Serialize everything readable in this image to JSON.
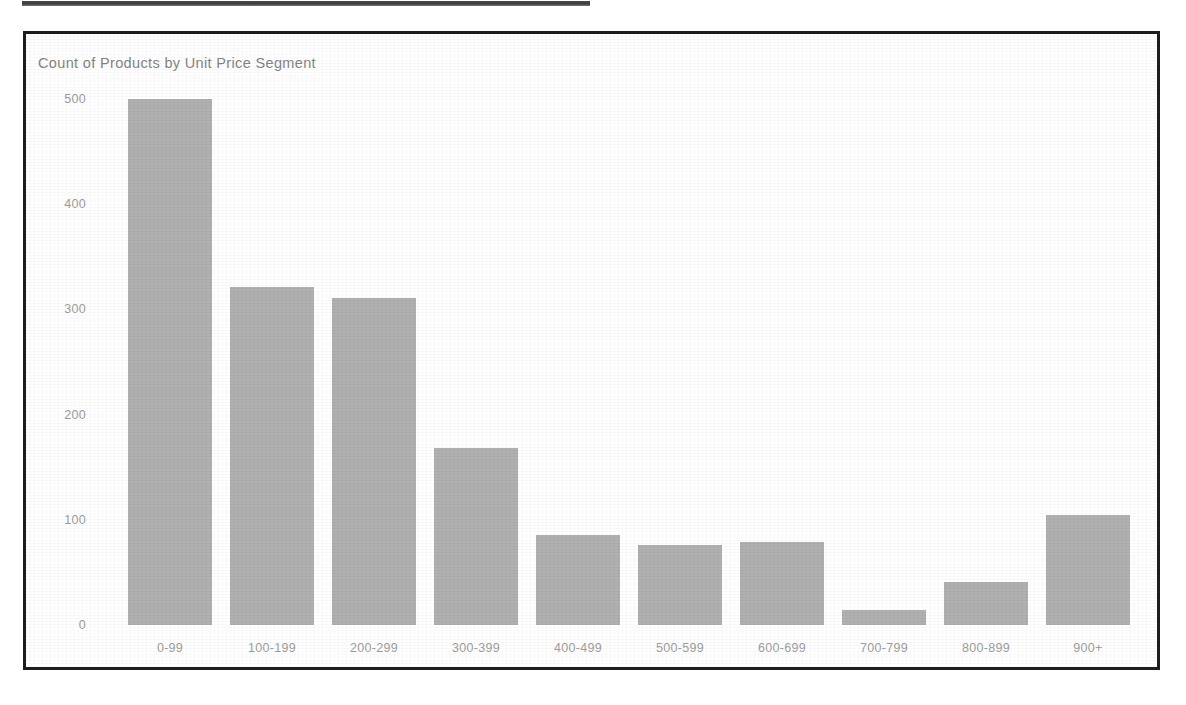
{
  "page": {
    "background_color": "#ffffff",
    "top_strip": {
      "name": "truncated-dark-bar",
      "color": "#2b2b2b"
    }
  },
  "chart_card": {
    "border_color": "#1d1d1d",
    "background_color": "#ffffff"
  },
  "chart_data": {
    "type": "bar",
    "title": "Count of Products by Unit Price Segment",
    "xlabel": "",
    "ylabel": "",
    "categories": [
      "0-99",
      "100-199",
      "200-299",
      "300-399",
      "400-499",
      "500-599",
      "600-699",
      "700-799",
      "800-899",
      "900+"
    ],
    "values": [
      500,
      321,
      311,
      168,
      86,
      76,
      79,
      14,
      41,
      105
    ],
    "ylim": [
      0,
      500
    ],
    "yticks": [
      0,
      100,
      200,
      300,
      400,
      500
    ],
    "ytick_labels": [
      "0",
      "100",
      "200",
      "300",
      "400",
      "500"
    ],
    "grid": false,
    "legend": null,
    "bar_color": "#b0b0b0",
    "axis_label_color": "#9e9e9e",
    "title_color": "#858585"
  }
}
